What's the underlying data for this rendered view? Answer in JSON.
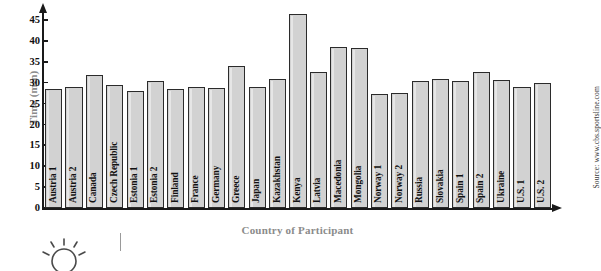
{
  "chart_data": {
    "type": "bar",
    "title": "",
    "xlabel": "Country of Participant",
    "ylabel": "Time (min)",
    "ylim": [
      0,
      47
    ],
    "yticks": [
      0,
      5,
      10,
      15,
      20,
      25,
      30,
      35,
      40,
      45
    ],
    "grid": false,
    "legend": null,
    "source": "Source: www.cbs.sportsline.com",
    "units": "min",
    "categories": [
      "Austria 1",
      "Austria 2",
      "Canada",
      "Czech Republic",
      "Estonia 1",
      "Estonia 2",
      "Finland",
      "France",
      "Germany",
      "Greece",
      "Japan",
      "Kazakhstan",
      "Kenya",
      "Latvia",
      "Macedonia",
      "Mongolia",
      "Norway 1",
      "Norway 2",
      "Russia",
      "Slovakia",
      "Spain 1",
      "Spain 2",
      "Ukraine",
      "U.S. 1",
      "U.S. 2"
    ],
    "values": [
      28.5,
      29.0,
      32.0,
      29.5,
      28.0,
      30.5,
      28.5,
      29.0,
      28.8,
      34.0,
      29.0,
      31.0,
      46.5,
      32.5,
      38.5,
      38.3,
      27.3,
      27.6,
      30.5,
      31.0,
      30.5,
      32.5,
      30.8,
      29.0,
      30.0
    ],
    "colors": {
      "bar_fill": "#d2d2d2",
      "bar_stroke": "#2b2b2b",
      "axis": "#1a1a1a",
      "axis_title": "#8b8b8b",
      "tick_label": "#111111",
      "background": "#ffffff"
    }
  },
  "decorations": {
    "sun_icon": "sun-icon",
    "divider": "vertical-rule"
  }
}
